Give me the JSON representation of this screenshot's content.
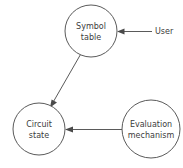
{
  "diagram": {
    "title": "",
    "background_color": "#ffffff",
    "stroke_color": "#5a5a5a",
    "text_color": "#3c3c3c",
    "nodes": [
      {
        "id": "symbol-table",
        "shape": "circle",
        "label_line1": "Symbol",
        "label_line2": "table",
        "cx": 91,
        "cy": 31,
        "r": 26
      },
      {
        "id": "circuit-state",
        "shape": "circle",
        "label_line1": "Circuit",
        "label_line2": "state",
        "cx": 39,
        "cy": 129,
        "r": 26
      },
      {
        "id": "evaluation-mechanism",
        "shape": "circle",
        "label_line1": "Evaluation",
        "label_line2": "mechanism",
        "cx": 151,
        "cy": 129,
        "r": 29
      }
    ],
    "edges": [
      {
        "id": "user-to-symbol-table",
        "label": "User",
        "from": "user",
        "to": "symbol-table",
        "direction": "left",
        "style": "solid"
      },
      {
        "id": "symbol-table-to-circuit-state",
        "label": "",
        "from": "symbol-table",
        "to": "circuit-state",
        "direction": "down-left",
        "style": "solid"
      },
      {
        "id": "evaluation-mechanism-to-circuit-state",
        "label": "",
        "from": "evaluation-mechanism",
        "to": "circuit-state",
        "direction": "left",
        "style": "solid"
      }
    ]
  }
}
